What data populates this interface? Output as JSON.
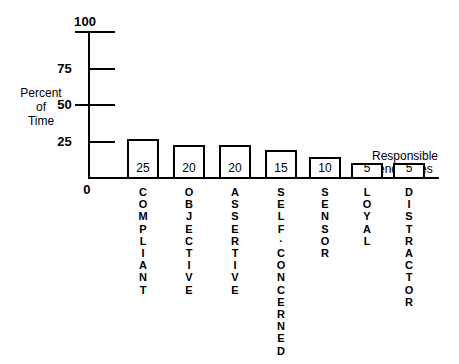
{
  "chart_data": {
    "type": "bar",
    "title": "",
    "xlabel": "Responsible Tendencies",
    "ylabel": "Percent of Time",
    "ylim": [
      0,
      100
    ],
    "yticks": [
      0,
      25,
      50,
      75,
      100
    ],
    "grid": false,
    "legend": "none",
    "categories": [
      "COMPLIANT",
      "OBJECTIVE",
      "ASSERTIVE",
      "SELF-CONCERNED",
      "SENSOR",
      "LOYAL",
      "DISTRACTOR"
    ],
    "values": [
      25,
      20,
      20,
      15,
      10,
      5,
      5
    ]
  },
  "axes": {
    "y_title_lines": [
      "Percent",
      "of",
      "Time"
    ],
    "x_title_lines": [
      "Responsible",
      "Tendencies"
    ],
    "tick_labels": {
      "t100": "100",
      "t75": "75",
      "t50": "50",
      "t25": "25",
      "t0": "0"
    }
  },
  "bars": [
    {
      "category": "COMPLIANT",
      "value_label": "25",
      "letters": [
        "C",
        "O",
        "M",
        "P",
        "L",
        "I",
        "A",
        "N",
        "T"
      ],
      "geom": {
        "left": 127,
        "top": 139,
        "width": 32,
        "height": 40
      }
    },
    {
      "category": "OBJECTIVE",
      "value_label": "20",
      "letters": [
        "O",
        "B",
        "J",
        "E",
        "C",
        "T",
        "I",
        "V",
        "E"
      ],
      "geom": {
        "left": 173,
        "top": 145,
        "width": 32,
        "height": 34
      }
    },
    {
      "category": "ASSERTIVE",
      "value_label": "20",
      "letters": [
        "A",
        "S",
        "S",
        "E",
        "R",
        "T",
        "I",
        "V",
        "E"
      ],
      "geom": {
        "left": 219,
        "top": 145,
        "width": 32,
        "height": 34
      }
    },
    {
      "category": "SELF-CONCERNED",
      "value_label": "15",
      "letters": [
        "S",
        "E",
        "L",
        "F",
        "·",
        "C",
        "O",
        "N",
        "C",
        "E",
        "R",
        "N",
        "E",
        "D"
      ],
      "geom": {
        "left": 265,
        "top": 150,
        "width": 32,
        "height": 29
      }
    },
    {
      "category": "SENSOR",
      "value_label": "10",
      "letters": [
        "S",
        "E",
        "N",
        "S",
        "O",
        "R"
      ],
      "geom": {
        "left": 309,
        "top": 157,
        "width": 32,
        "height": 22
      }
    },
    {
      "category": "LOYAL",
      "value_label": "5",
      "letters": [
        "L",
        "O",
        "Y",
        "A",
        "L"
      ],
      "geom": {
        "left": 351,
        "top": 163,
        "width": 32,
        "height": 16
      }
    },
    {
      "category": "DISTRACTOR",
      "value_label": "5",
      "letters": [
        "D",
        "I",
        "S",
        "T",
        "R",
        "A",
        "C",
        "T",
        "O",
        "R"
      ],
      "geom": {
        "left": 393,
        "top": 163,
        "width": 32,
        "height": 16
      }
    }
  ],
  "colors": {
    "ink": "#000000",
    "background": "#ffffff",
    "bar_fill": "#ffffff"
  }
}
